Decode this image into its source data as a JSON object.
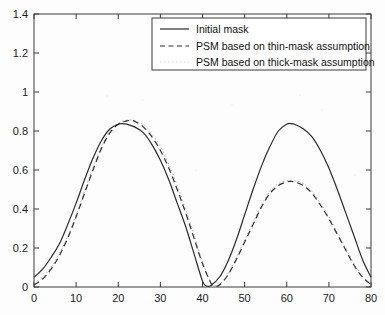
{
  "chart_data": {
    "type": "line",
    "title": "",
    "xlabel": "",
    "ylabel": "",
    "xlim": [
      0,
      80
    ],
    "ylim": [
      0,
      1.4
    ],
    "xticks": [
      0,
      10,
      20,
      30,
      40,
      50,
      60,
      70,
      80
    ],
    "yticks": [
      0,
      0.2,
      0.4,
      0.6,
      0.8,
      1,
      1.2,
      1.4
    ],
    "xtick_labels": [
      "0",
      "10",
      "20",
      "30",
      "40",
      "50",
      "60",
      "70",
      "80"
    ],
    "ytick_labels": [
      "0",
      "0.2",
      "0.4",
      "0.6",
      "0.8",
      "1",
      "1.2",
      "1.4"
    ],
    "grid": false,
    "legend_position": "top-right",
    "series": [
      {
        "name": "Initial mask",
        "style": "solid",
        "color": "#2a2a2a",
        "x": [
          0,
          2,
          4,
          6,
          8,
          10,
          12,
          14,
          16,
          18,
          20,
          21,
          22,
          24,
          26,
          28,
          30,
          32,
          34,
          36,
          38,
          40,
          41,
          42,
          44,
          46,
          48,
          50,
          52,
          54,
          56,
          58,
          60,
          61,
          62,
          64,
          66,
          68,
          70,
          72,
          74,
          76,
          78,
          80
        ],
        "y": [
          0.05,
          0.09,
          0.15,
          0.22,
          0.32,
          0.43,
          0.55,
          0.66,
          0.75,
          0.81,
          0.835,
          0.838,
          0.835,
          0.82,
          0.79,
          0.73,
          0.65,
          0.55,
          0.43,
          0.31,
          0.17,
          0.03,
          0.005,
          0.008,
          0.05,
          0.13,
          0.24,
          0.37,
          0.5,
          0.62,
          0.72,
          0.8,
          0.835,
          0.838,
          0.833,
          0.81,
          0.77,
          0.7,
          0.61,
          0.5,
          0.38,
          0.26,
          0.14,
          0.05
        ]
      },
      {
        "name": "PSM based on thin-mask assumption",
        "style": "dashed",
        "color": "#2f2f2f",
        "x": [
          0,
          2,
          4,
          6,
          8,
          10,
          12,
          14,
          16,
          18,
          20,
          22,
          23,
          24,
          26,
          28,
          30,
          32,
          34,
          36,
          38,
          40,
          42,
          43,
          44,
          46,
          48,
          50,
          52,
          54,
          56,
          58,
          60,
          61,
          62,
          64,
          66,
          68,
          70,
          72,
          74,
          76,
          78,
          80
        ],
        "y": [
          0.01,
          0.04,
          0.09,
          0.16,
          0.25,
          0.36,
          0.48,
          0.6,
          0.71,
          0.79,
          0.835,
          0.852,
          0.853,
          0.849,
          0.82,
          0.77,
          0.7,
          0.61,
          0.5,
          0.38,
          0.25,
          0.12,
          0.02,
          0.006,
          0.01,
          0.06,
          0.14,
          0.23,
          0.32,
          0.41,
          0.48,
          0.52,
          0.539,
          0.541,
          0.538,
          0.52,
          0.48,
          0.42,
          0.35,
          0.27,
          0.19,
          0.11,
          0.05,
          0.012
        ]
      },
      {
        "name": "PSM based on thick-mask assumption",
        "style": "dotted",
        "color": "#9a9a9a",
        "x": [
          0,
          2,
          4,
          6,
          8,
          10,
          12,
          14,
          16,
          18,
          20,
          22,
          23,
          24,
          26,
          28,
          30,
          32,
          34,
          36,
          38,
          40,
          42,
          43,
          44,
          46,
          48,
          50,
          52,
          54,
          56,
          58,
          60,
          61,
          62,
          64,
          66,
          68,
          70,
          72,
          74,
          76,
          78,
          80
        ],
        "y": [
          0.02,
          0.05,
          0.1,
          0.17,
          0.26,
          0.37,
          0.49,
          0.61,
          0.72,
          0.8,
          0.84,
          0.856,
          0.857,
          0.852,
          0.83,
          0.785,
          0.72,
          0.63,
          0.52,
          0.4,
          0.27,
          0.13,
          0.025,
          0.008,
          0.012,
          0.065,
          0.15,
          0.24,
          0.33,
          0.42,
          0.49,
          0.53,
          0.545,
          0.547,
          0.544,
          0.53,
          0.49,
          0.43,
          0.36,
          0.28,
          0.2,
          0.12,
          0.055,
          0.015
        ]
      }
    ]
  },
  "legend": {
    "items": [
      {
        "label": "Initial mask",
        "style": "solid"
      },
      {
        "label": "PSM based on thin-mask assumption",
        "style": "dashed"
      },
      {
        "label": "PSM based on thick-mask assumption",
        "style": "dotted"
      }
    ]
  },
  "colors": {
    "axis": "#3a3a3a",
    "solid_curve": "#2a2a2a",
    "dashed_curve": "#2f2f2f",
    "dotted_curve": "#9a9a9a",
    "background": "#fdfdfd"
  }
}
